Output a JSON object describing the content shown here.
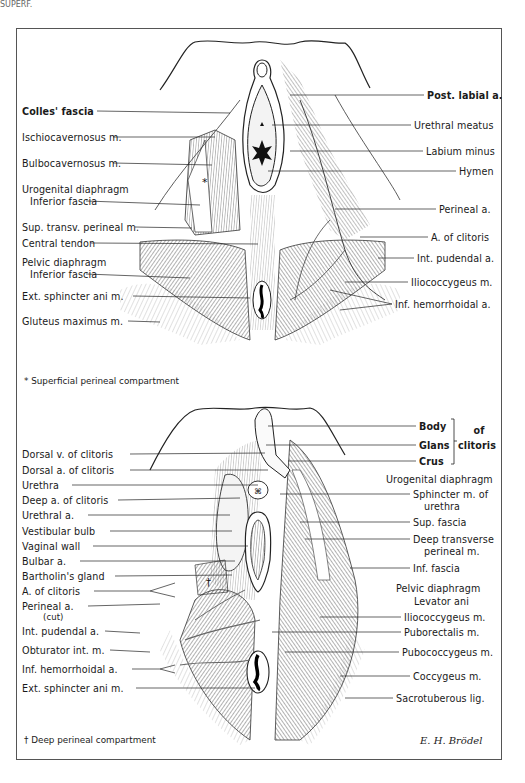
{
  "figure": {
    "top_cropped_text": "SUPERF.",
    "top_panel": {
      "left_labels": [
        {
          "text": "Colles' fascia",
          "x": 22,
          "y": 106
        },
        {
          "text": "Ischiocavernosus m.",
          "x": 22,
          "y": 132
        },
        {
          "text": "Bulbocavernosus m.",
          "x": 22,
          "y": 158
        },
        {
          "text": "Urogenital diaphragm",
          "x": 22,
          "y": 184
        },
        {
          "text": "Inferior fascia",
          "x": 30,
          "y": 196
        },
        {
          "text": "Sup. transv. perineal m.",
          "x": 22,
          "y": 222
        },
        {
          "text": "Central tendon",
          "x": 22,
          "y": 238
        },
        {
          "text": "Pelvic diaphragm",
          "x": 22,
          "y": 257
        },
        {
          "text": "Inferior fascia",
          "x": 30,
          "y": 269
        },
        {
          "text": "Ext. sphincter ani m.",
          "x": 22,
          "y": 291
        },
        {
          "text": "Gluteus maximus m.",
          "x": 22,
          "y": 316
        }
      ],
      "right_labels": [
        {
          "text": "Post. labial a.",
          "x": 427,
          "y": 90
        },
        {
          "text": "Urethral meatus",
          "x": 414,
          "y": 120
        },
        {
          "text": "Labium minus",
          "x": 426,
          "y": 146
        },
        {
          "text": "Hymen",
          "x": 459,
          "y": 166
        },
        {
          "text": "Perineal a.",
          "x": 439,
          "y": 204
        },
        {
          "text": "A. of clitoris",
          "x": 431,
          "y": 232
        },
        {
          "text": "Int. pudendal a.",
          "x": 417,
          "y": 253
        },
        {
          "text": "Iliococcygeus m.",
          "x": 411,
          "y": 277
        },
        {
          "text": "Inf. hemorrhoidal a.",
          "x": 395,
          "y": 299
        }
      ],
      "footnote": "* Superficial perineal compartment",
      "marker": "*"
    },
    "bottom_panel": {
      "left_labels": [
        {
          "text": "Dorsal v. of clitoris",
          "x": 22,
          "y": 449
        },
        {
          "text": "Dorsal a. of clitoris",
          "x": 22,
          "y": 465
        },
        {
          "text": "Urethra",
          "x": 22,
          "y": 480
        },
        {
          "text": "Deep a. of clitoris",
          "x": 22,
          "y": 495
        },
        {
          "text": "Urethral a.",
          "x": 22,
          "y": 510
        },
        {
          "text": "Vestibular bulb",
          "x": 22,
          "y": 526
        },
        {
          "text": "Vaginal wall",
          "x": 22,
          "y": 541
        },
        {
          "text": "Bulbar a.",
          "x": 22,
          "y": 556
        },
        {
          "text": "Bartholin's gland",
          "x": 22,
          "y": 571
        },
        {
          "text": "A. of clitoris",
          "x": 22,
          "y": 586
        },
        {
          "text": "Perineal a.",
          "x": 22,
          "y": 601
        },
        {
          "text": "(cut)",
          "x": 43,
          "y": 612
        },
        {
          "text": "Int. pudendal a.",
          "x": 22,
          "y": 626
        },
        {
          "text": "Obturator int. m.",
          "x": 22,
          "y": 645
        },
        {
          "text": "Inf. hemorrhoidal a.",
          "x": 22,
          "y": 664
        },
        {
          "text": "Ext. sphincter ani m.",
          "x": 22,
          "y": 683
        }
      ],
      "clitoris_group": {
        "parts": [
          {
            "text": "Body",
            "x": 419,
            "y": 421
          },
          {
            "text": "Glans",
            "x": 419,
            "y": 440
          },
          {
            "text": "Crus",
            "x": 419,
            "y": 456
          }
        ],
        "suffix_line1": "of",
        "suffix_line2": "clitoris"
      },
      "right_labels": [
        {
          "text": "Urogenital diaphragm",
          "x": 386,
          "y": 474
        },
        {
          "text": "Sphincter m. of",
          "x": 413,
          "y": 489
        },
        {
          "text": "urethra",
          "x": 424,
          "y": 501
        },
        {
          "text": "Sup. fascia",
          "x": 413,
          "y": 517
        },
        {
          "text": "Deep transverse",
          "x": 413,
          "y": 534
        },
        {
          "text": "perineal m.",
          "x": 424,
          "y": 546
        },
        {
          "text": "Inf. fascia",
          "x": 413,
          "y": 563
        },
        {
          "text": "Pelvic diaphragm",
          "x": 396,
          "y": 583
        },
        {
          "text": "Levator ani",
          "x": 414,
          "y": 596
        },
        {
          "text": "Iliococcygeus m.",
          "x": 404,
          "y": 612
        },
        {
          "text": "Puborectalis m.",
          "x": 404,
          "y": 627
        },
        {
          "text": "Pubococcygeus m.",
          "x": 402,
          "y": 647
        },
        {
          "text": "Coccygeus m.",
          "x": 413,
          "y": 671
        },
        {
          "text": "Sacrotuberous lig.",
          "x": 396,
          "y": 693
        }
      ],
      "footnote": "† Deep perineal compartment",
      "marker": "†"
    },
    "signature": "E. H. Brödel"
  },
  "colors": {
    "ink": "#1a1a1a",
    "frame": "#555555",
    "background": "#ffffff",
    "shade": "#8a8a8a"
  }
}
